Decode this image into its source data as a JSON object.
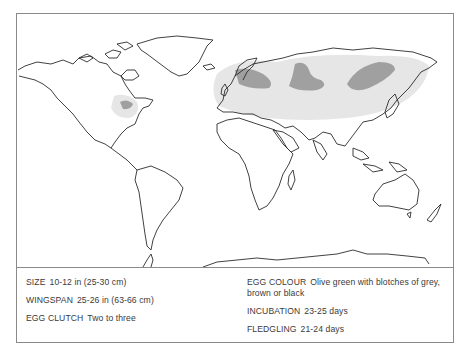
{
  "map": {
    "title": "World distribution map",
    "legend": {
      "breeding_range_color": "#9a9a9a",
      "wider_range_color": "#e4e4e4",
      "coast_color": "#2a2a2a"
    },
    "regions": [
      {
        "name": "north-america-breeding-patch",
        "shade": "dark"
      },
      {
        "name": "europe-range",
        "shade": "light"
      },
      {
        "name": "scandinavia-breeding-patch",
        "shade": "dark"
      },
      {
        "name": "western-siberia-breeding-patch",
        "shade": "dark"
      },
      {
        "name": "eastern-siberia-breeding-patch",
        "shade": "dark"
      },
      {
        "name": "eurasia-wider-range",
        "shade": "light"
      }
    ]
  },
  "facts": {
    "left": [
      {
        "label": "SIZE",
        "value": "10-12 in (25-30 cm)"
      },
      {
        "label": "WINGSPAN",
        "value": "25-26 in (63-66 cm)"
      },
      {
        "label": "EGG CLUTCH",
        "value": "Two to three"
      }
    ],
    "right": [
      {
        "label": "EGG COLOUR",
        "value": "Olive green with blotches of grey, brown or black"
      },
      {
        "label": "INCUBATION",
        "value": "23-25 days"
      },
      {
        "label": "FLEDGLING",
        "value": "21-24 days"
      }
    ]
  }
}
